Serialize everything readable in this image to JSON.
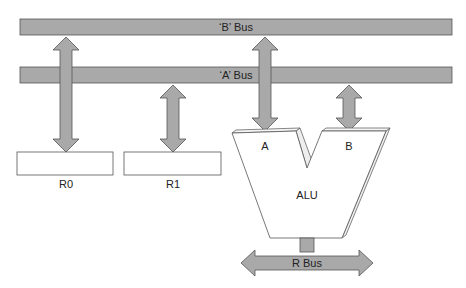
{
  "diagram": {
    "buses": {
      "b_bus": {
        "label": "‘B’ Bus"
      },
      "a_bus": {
        "label": "‘A’ Bus"
      },
      "r_bus": {
        "label": "R Bus"
      }
    },
    "registers": [
      {
        "label": "R0"
      },
      {
        "label": "R1"
      }
    ],
    "alu": {
      "label": "ALU",
      "input_a": "A",
      "input_b": "B"
    },
    "colors": {
      "bus_fill": "#a9a9a9",
      "bus_stroke": "#555555",
      "box_fill": "#ffffff",
      "box_stroke": "#555555"
    }
  }
}
